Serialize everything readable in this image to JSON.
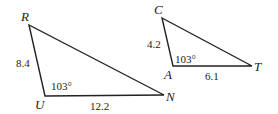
{
  "triangle_run": {
    "vertices": {
      "R": "R",
      "U": "U",
      "N": "N"
    },
    "side_RU": "8.4",
    "side_UN": "12.2",
    "angle_U": "103°"
  },
  "triangle_cat": {
    "vertices": {
      "C": "C",
      "A": "A",
      "T": "T"
    },
    "side_CA": "4.2",
    "side_AT": "6.1",
    "angle_A": "103°"
  },
  "colors": {
    "stroke": "#222222",
    "background": "#ffffff"
  }
}
